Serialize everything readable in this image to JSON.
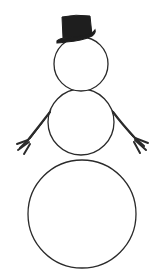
{
  "image": {
    "subject": "snowman line drawing",
    "width": 163,
    "height": 277,
    "background": "#ffffff",
    "stroke_color": "#2a2a2a",
    "hat_color": "#1e1e1e"
  },
  "parts": {
    "head": {
      "cx": 81,
      "cy": 64,
      "r": 27
    },
    "torso": {
      "cx": 81,
      "cy": 122,
      "r": 33
    },
    "base": {
      "cx": 82,
      "cy": 214,
      "r": 54
    },
    "hat": {
      "type": "top-hat"
    },
    "left_arm": {
      "type": "stick-arm"
    },
    "right_arm": {
      "type": "stick-arm"
    }
  }
}
